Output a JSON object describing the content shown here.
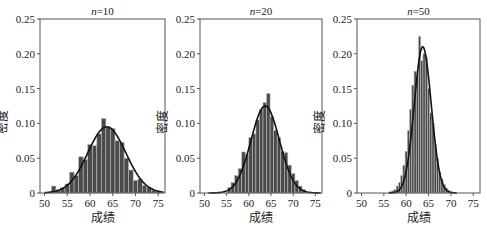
{
  "chart_data": [
    {
      "type": "bar",
      "title": "n=10",
      "title_var": "n",
      "title_value": "=10",
      "xlabel": "成绩",
      "ylabel": "密度",
      "xlim": [
        49,
        76.5
      ],
      "ylim": [
        0,
        0.25
      ],
      "xticks": [
        50,
        55,
        60,
        65,
        70,
        75
      ],
      "yticks": [
        "0",
        "0.05",
        "0.10",
        "0.15",
        "0.20",
        "0.25"
      ],
      "bin_width": 1,
      "x": [
        52,
        53,
        54,
        55,
        56,
        57,
        58,
        59,
        60,
        61,
        62,
        63,
        64,
        65,
        66,
        67,
        68,
        69,
        70,
        71,
        72,
        73,
        74,
        75
      ],
      "values": [
        0.01,
        0.005,
        0.008,
        0.013,
        0.03,
        0.025,
        0.052,
        0.048,
        0.07,
        0.068,
        0.085,
        0.107,
        0.094,
        0.093,
        0.075,
        0.073,
        0.05,
        0.033,
        0.018,
        0.02,
        0.011,
        0.008,
        0.004,
        0.003
      ],
      "fit_curve": {
        "mean": 63.7,
        "sd": 4.2,
        "peak": 0.095
      },
      "grid": false
    },
    {
      "type": "bar",
      "title": "n=20",
      "title_var": "n",
      "title_value": "=20",
      "xlabel": "成绩",
      "ylabel": "密度",
      "xlim": [
        49,
        76.5
      ],
      "ylim": [
        0,
        0.25
      ],
      "xticks": [
        50,
        55,
        60,
        65,
        70,
        75
      ],
      "yticks": [
        "0",
        "0.05",
        "0.10",
        "0.15",
        "0.20",
        "0.25"
      ],
      "bin_width": 0.8,
      "x": [
        55.6,
        56.4,
        57.2,
        58.0,
        58.8,
        59.6,
        60.4,
        61.2,
        62.0,
        62.8,
        63.6,
        64.4,
        65.2,
        66.0,
        66.8,
        67.6,
        68.4,
        69.2,
        70.0,
        70.8,
        71.6,
        72.4
      ],
      "values": [
        0.008,
        0.015,
        0.025,
        0.035,
        0.059,
        0.055,
        0.08,
        0.085,
        0.105,
        0.12,
        0.13,
        0.143,
        0.11,
        0.09,
        0.08,
        0.06,
        0.058,
        0.04,
        0.028,
        0.018,
        0.01,
        0.005
      ],
      "fit_curve": {
        "mean": 63.7,
        "sd": 3.2,
        "peak": 0.125
      },
      "grid": false
    },
    {
      "type": "bar",
      "title": "n=50",
      "title_var": "n",
      "title_value": "=50",
      "xlabel": "成绩",
      "ylabel": "密度",
      "xlim": [
        49,
        76.5
      ],
      "ylim": [
        0,
        0.25
      ],
      "xticks": [
        50,
        55,
        60,
        65,
        70,
        75
      ],
      "yticks": [
        "0",
        "0.05",
        "0.10",
        "0.15",
        "0.20",
        "0.25"
      ],
      "bin_width": 0.5,
      "x": [
        56.5,
        57.0,
        57.5,
        58.0,
        58.5,
        59.0,
        59.5,
        60.0,
        60.5,
        61.0,
        61.5,
        62.0,
        62.5,
        63.0,
        63.5,
        64.0,
        64.5,
        65.0,
        65.5,
        66.0,
        66.5,
        67.0,
        67.5,
        68.0,
        68.5,
        69.0,
        69.5,
        70.0,
        70.5
      ],
      "values": [
        0.002,
        0.003,
        0.005,
        0.01,
        0.015,
        0.025,
        0.04,
        0.06,
        0.09,
        0.12,
        0.155,
        0.175,
        0.17,
        0.225,
        0.19,
        0.2,
        0.195,
        0.15,
        0.115,
        0.1,
        0.07,
        0.05,
        0.03,
        0.02,
        0.012,
        0.007,
        0.004,
        0.002,
        0.001
      ],
      "fit_curve": {
        "mean": 63.7,
        "sd": 1.9,
        "peak": 0.21
      },
      "grid": false
    }
  ],
  "panels": [
    {
      "title_var": "n",
      "title_value": "=10",
      "xlabel": "成绩",
      "ylabel": "密度"
    },
    {
      "title_var": "n",
      "title_value": "=20",
      "xlabel": "成绩",
      "ylabel": "密度"
    },
    {
      "title_var": "n",
      "title_value": "=50",
      "xlabel": "成绩",
      "ylabel": "密度"
    }
  ],
  "colors": {
    "bar_fill": "#4a4a4a",
    "bar_edge": "#bdbdbd",
    "curve": "#111111",
    "axis": "#555555"
  }
}
